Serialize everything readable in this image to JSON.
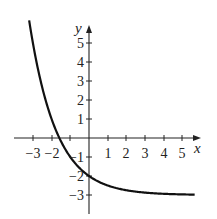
{
  "chart_data": {
    "type": "line",
    "title": "",
    "xlabel": "x",
    "ylabel": "y",
    "function": "y = 2^(-x) - 3",
    "asymptote": -3,
    "xlim": [
      -3.5,
      5.6
    ],
    "ylim": [
      -3.9,
      6.2
    ],
    "x_ticks": [
      "-3",
      "-2",
      "-1",
      "1",
      "2",
      "3",
      "4",
      "5"
    ],
    "y_ticks": [
      "5",
      "4",
      "3",
      "2",
      "1",
      "-1",
      "-2",
      "-3"
    ],
    "grid": false,
    "series": [
      {
        "name": "curve",
        "x": [
          -3.2,
          -3,
          -2.5,
          -2,
          -1.58,
          -1,
          -0.5,
          0,
          0.5,
          1,
          2,
          3,
          4,
          5,
          5.6
        ],
        "values": [
          6.19,
          5,
          2.66,
          1,
          0,
          -1,
          -1.59,
          -2,
          -2.29,
          -2.5,
          -2.75,
          -2.88,
          -2.94,
          -2.97,
          -2.98
        ]
      }
    ]
  },
  "labels": {
    "x_axis": "x",
    "y_axis": "y",
    "xt": [
      "−3",
      "−2",
      "1",
      "2",
      "3",
      "4",
      "5"
    ],
    "yt": [
      "5",
      "4",
      "3",
      "2",
      "1",
      "−1",
      "−2",
      "−3"
    ],
    "xt_neg1": "−1"
  }
}
